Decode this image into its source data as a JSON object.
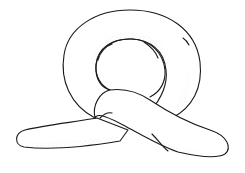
{
  "figure": {
    "style": "pen line drawing with stippled shading",
    "colors": {
      "background": "#ffffff",
      "line": "#1a1a1a",
      "stipple": "#9a9a9a"
    }
  }
}
